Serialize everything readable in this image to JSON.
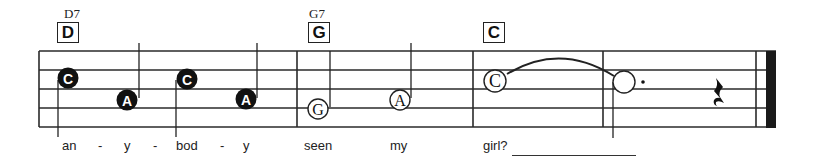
{
  "chords": [
    {
      "name": "D7",
      "box": "D"
    },
    {
      "name": "G7",
      "box": "G"
    },
    {
      "name": "",
      "box": "C"
    }
  ],
  "notes": [
    {
      "letter": "C",
      "style": "filled",
      "measure": 1
    },
    {
      "letter": "A",
      "style": "filled",
      "measure": 1
    },
    {
      "letter": "C",
      "style": "filled",
      "measure": 1
    },
    {
      "letter": "A",
      "style": "filled",
      "measure": 1
    },
    {
      "letter": "G",
      "style": "half",
      "measure": 2
    },
    {
      "letter": "A",
      "style": "half",
      "measure": 2
    },
    {
      "letter": "C",
      "style": "half",
      "measure": 3
    },
    {
      "letter": "",
      "style": "dotted-half",
      "measure": 4,
      "tied": true
    },
    {
      "letter": "",
      "style": "quarter-rest",
      "measure": 4
    }
  ],
  "lyrics": [
    "an",
    "-",
    "y",
    "-",
    "bod",
    "-",
    "y",
    "seen",
    "my",
    "girl?"
  ],
  "colors": {
    "ink": "#222222",
    "background": "#ffffff"
  }
}
